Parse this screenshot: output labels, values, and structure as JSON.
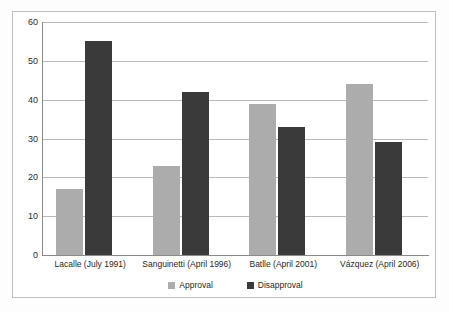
{
  "chart_data": {
    "type": "bar",
    "title": "",
    "subtitle": "",
    "xlabel": "",
    "ylabel": "",
    "ylim": [
      0,
      60
    ],
    "ytick_step": 10,
    "yticks": [
      60,
      50,
      40,
      30,
      20,
      10,
      0
    ],
    "grid": true,
    "legend_position": "bottom",
    "categories": [
      "Lacalle (July 1991)",
      "Sanguinetti (April 1996)",
      "Batlle (April 2001)",
      "Vázquez (April 2006)"
    ],
    "series": [
      {
        "name": "Approval",
        "color": "#ACACAC",
        "values": [
          17,
          23,
          39,
          44
        ]
      },
      {
        "name": "Disapproval",
        "color": "#3A3A3A",
        "values": [
          55,
          42,
          33,
          29
        ]
      }
    ]
  },
  "figure": {
    "background": "#ffffff",
    "frame_color": "#bfbfbf",
    "axis_color": "#8a8a8a",
    "gridline_color": "#b9b9b9"
  }
}
